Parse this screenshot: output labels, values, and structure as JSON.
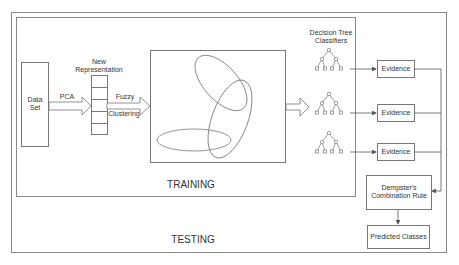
{
  "diagram": {
    "sections": {
      "training": "TRAINING",
      "testing": "TESTING"
    },
    "nodes": {
      "dataset": {
        "line1": "Data",
        "line2": "Set"
      },
      "new_representation": {
        "line1": "New",
        "line2": "Representation"
      },
      "decision_tree_classifiers": {
        "line1": "Decision Tree",
        "line2": "Classifiers"
      },
      "evidence": [
        "Evidence",
        "Evidence",
        "Evidence"
      ],
      "dempster": {
        "line1": "Dempster's",
        "line2": "Combination Rule"
      },
      "predicted": "Predicted Classes"
    },
    "edges": {
      "pca": "PCA",
      "fuzzy": "Fuzzy",
      "clustering": "Clustering"
    },
    "colors": {
      "stroke": "#777777",
      "text": "#333333",
      "background": "#ffffff"
    }
  }
}
